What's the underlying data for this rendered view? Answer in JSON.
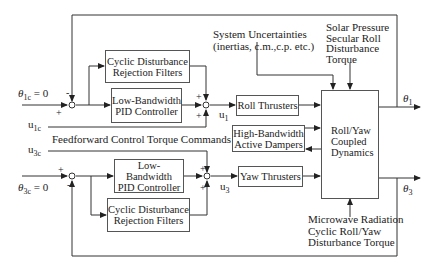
{
  "diagram": {
    "type": "control-block-diagram",
    "inputs": {
      "theta1c": {
        "symbol": "θ",
        "sub": "1c",
        "value": "= 0"
      },
      "theta3c": {
        "symbol": "θ",
        "sub": "3c",
        "value": "= 0"
      },
      "u1c": {
        "symbol": "u",
        "sub": "1c"
      },
      "u3c": {
        "symbol": "u",
        "sub": "3c"
      }
    },
    "feedforward_label": "Feedforward Control Torque Commands",
    "blocks": {
      "cyclic_top": {
        "line1": "Cyclic Disturbance",
        "line2": "Rejection Filters"
      },
      "pid_top": {
        "line1": "Low-Bandwidth",
        "line2": "PID Controller"
      },
      "roll_thrusters": {
        "line1": "Roll Thrusters"
      },
      "dampers": {
        "line1": "High-Bandwidth",
        "line2": "Active Dampers"
      },
      "yaw_thrusters": {
        "line1": "Yaw Thrusters"
      },
      "dynamics": {
        "line1": "Roll/Yaw",
        "line2": "Coupled",
        "line3": "Dynamics"
      },
      "pid_bottom": {
        "line1": "Low-Bandwidth",
        "line2": "PID Controller"
      },
      "cyclic_bottom": {
        "line1": "Cyclic Disturbance",
        "line2": "Rejection Filters"
      }
    },
    "signals": {
      "u1": {
        "symbol": "u",
        "sub": "1"
      },
      "u3": {
        "symbol": "u",
        "sub": "3"
      },
      "theta1": {
        "symbol": "θ",
        "sub": "1"
      },
      "theta3": {
        "symbol": "θ",
        "sub": "3"
      }
    },
    "disturbances": {
      "uncertainties": {
        "line1": "System Uncertainties",
        "line2": "(inertias, c.m.,c.p. etc.)"
      },
      "solar": {
        "line1": "Solar Pressure",
        "line2": "Secular  Roll",
        "line3": "Disturbance",
        "line4": "Torque"
      },
      "microwave": {
        "line1": "Microwave Radiation",
        "line2": "Cyclic Roll/Yaw",
        "line3": "Disturbance Torque"
      }
    },
    "signs": {
      "plus": "+",
      "minus": "-"
    }
  }
}
